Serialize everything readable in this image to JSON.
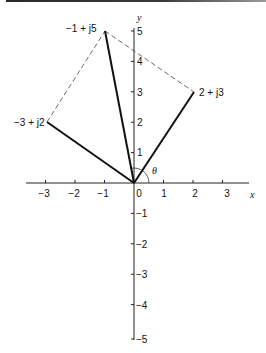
{
  "diagram": {
    "type": "complex-plane-phasor",
    "axes": {
      "x_label": "x",
      "y_label": "y",
      "x_ticks": [
        {
          "value": -3,
          "label": "−3"
        },
        {
          "value": -2,
          "label": "−2"
        },
        {
          "value": -1,
          "label": "−1"
        },
        {
          "value": 0,
          "label": "0"
        },
        {
          "value": 1,
          "label": "1"
        },
        {
          "value": 2,
          "label": "2"
        },
        {
          "value": 3,
          "label": "3"
        }
      ],
      "y_ticks": [
        {
          "value": 5,
          "label": "5"
        },
        {
          "value": 4,
          "label": "4"
        },
        {
          "value": 3,
          "label": "3"
        },
        {
          "value": 2,
          "label": "2"
        },
        {
          "value": 1,
          "label": "1"
        },
        {
          "value": -1,
          "label": "−1"
        },
        {
          "value": -2,
          "label": "−2"
        },
        {
          "value": -3,
          "label": "−3"
        },
        {
          "value": -4,
          "label": "−4"
        },
        {
          "value": -5,
          "label": "−5"
        }
      ]
    },
    "vectors": [
      {
        "label": "−3 + j2",
        "x": -3,
        "y": 2,
        "style": "solid"
      },
      {
        "label": "−1 + j5",
        "x": -1,
        "y": 5,
        "style": "solid"
      },
      {
        "label": "2 + j3",
        "x": 2,
        "y": 3,
        "style": "solid"
      }
    ],
    "dashed_edges": [
      {
        "from": "−3 + j2",
        "to": "−1 + j5"
      },
      {
        "from": "−1 + j5",
        "to": "2 + j3"
      }
    ],
    "angle": {
      "label": "θ",
      "from_deg": 0,
      "to_deg": 101
    }
  }
}
